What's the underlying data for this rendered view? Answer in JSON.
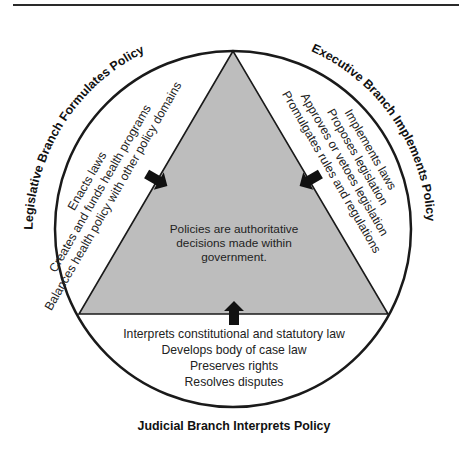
{
  "diagram": {
    "center_text": [
      "Policies are authoritative",
      "decisions made within",
      "government."
    ],
    "legislative": {
      "title": "Legislative Branch Formulates Policy",
      "items": [
        "Enacts laws",
        "Creates and funds health programs",
        "Balances health policy with other policy domains"
      ]
    },
    "executive": {
      "title": "Executive Branch Implements Policy",
      "items": [
        "Implements laws",
        "Proposes legislation",
        "Approves or vetoes legislation",
        "Promulgates rules and regulations"
      ]
    },
    "judicial": {
      "title": "Judicial Branch Interprets Policy",
      "items": [
        "Interprets constitutional and statutory law",
        "Develops body of case law",
        "Preserves rights",
        "Resolves disputes"
      ]
    },
    "colors": {
      "triangle_fill": "#bdbdbd",
      "outline": "#1a1a1a",
      "arrow": "#111111"
    }
  }
}
